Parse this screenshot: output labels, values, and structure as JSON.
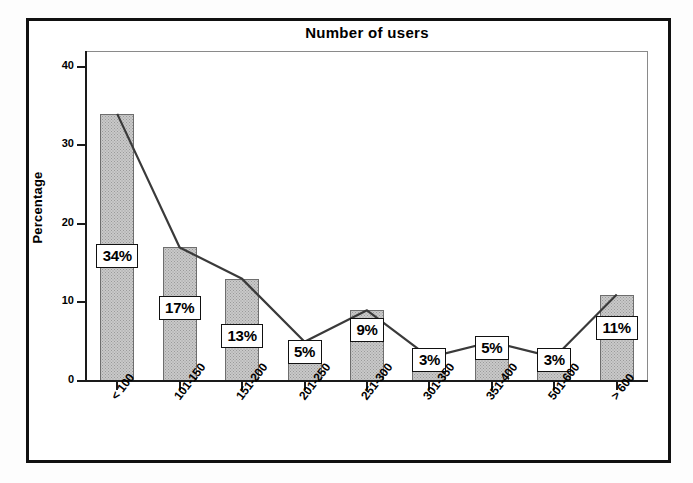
{
  "chart_data": {
    "type": "bar",
    "title": "Number of users",
    "xlabel": "",
    "ylabel": "Percentage",
    "ylim": [
      0,
      42
    ],
    "yticks": [
      0,
      10,
      20,
      30,
      40
    ],
    "ytick_labels": [
      "0",
      "10",
      "20",
      "30",
      "40"
    ],
    "grid": false,
    "legend": "none",
    "categories": [
      "< 100",
      "101-150",
      "151-200",
      "201-250",
      "251-300",
      "301-350",
      "351-400",
      "501-600",
      "> 600"
    ],
    "values": [
      34,
      17,
      13,
      5,
      9,
      3,
      5,
      3,
      11
    ],
    "data_labels": [
      "34%",
      "17%",
      "13%",
      "5%",
      "9%",
      "3%",
      "5%",
      "3%",
      "11%"
    ],
    "series": [
      {
        "name": "Percentage bars",
        "type": "bar",
        "values": [
          34,
          17,
          13,
          5,
          9,
          3,
          5,
          3,
          11
        ]
      },
      {
        "name": "Percentage line",
        "type": "line",
        "values": [
          34,
          17,
          13,
          5,
          9,
          3,
          5,
          3,
          11
        ]
      }
    ],
    "colors": {
      "bar_fill": "#c9c9c9",
      "bar_border": "#6e6e6e",
      "line": "#3a3a3a",
      "axis": "#1a1a1a",
      "label_box_bg": "#ffffff",
      "label_box_border": "#111111",
      "frame": "#111111"
    }
  }
}
